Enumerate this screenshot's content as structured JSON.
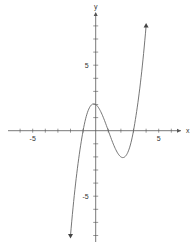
{
  "chart_data": {
    "type": "line",
    "title": "",
    "xlabel": "x",
    "ylabel": "y",
    "xlim": [
      -7,
      7
    ],
    "ylim": [
      -9,
      9
    ],
    "grid": false,
    "x_tick_labels": [
      {
        "value": -5,
        "label": "-5"
      },
      {
        "value": 5,
        "label": "5"
      }
    ],
    "y_tick_labels": [
      {
        "value": 5,
        "label": "5"
      },
      {
        "value": -5,
        "label": "-5"
      }
    ],
    "x_ticks": [
      -6,
      -5,
      -4,
      -3,
      -2,
      -1,
      1,
      2,
      3,
      4,
      5,
      6
    ],
    "y_ticks": [
      -8,
      -7,
      -6,
      -5,
      -4,
      -3,
      -2,
      -1,
      1,
      2,
      3,
      4,
      5,
      6,
      7,
      8
    ],
    "series": [
      {
        "name": "f(x)",
        "description": "cubic with zeros at x=-1, 1, 3; local max (0,2); local min (2,-2); arrows at both ends",
        "x": [
          -2.0,
          -1.5,
          -1.0,
          -0.5,
          0.0,
          0.5,
          1.0,
          1.5,
          2.0,
          2.5,
          3.0,
          3.5,
          4.0
        ],
        "y": [
          -8.0,
          -3.9,
          0.0,
          1.6,
          2.0,
          1.6,
          0.0,
          -1.3,
          -2.0,
          -1.6,
          0.0,
          3.2,
          8.0
        ]
      }
    ],
    "colors": {
      "axis": "#555555",
      "curve": "#666666"
    }
  }
}
